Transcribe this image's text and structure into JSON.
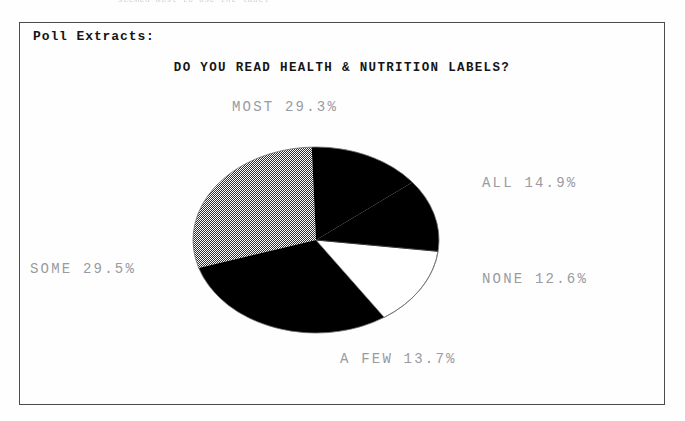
{
  "page": {
    "cut_off_running_text": "seemed most to use the label"
  },
  "panel": {
    "label": "Poll Extracts:"
  },
  "chart_data": {
    "type": "pie",
    "title": "DO YOU READ HEALTH & NUTRITION LABELS?",
    "xlabel": "",
    "ylabel": "",
    "legend_position": "around-slices",
    "grid": false,
    "categories": [
      "MOST",
      "SOME",
      "ALL",
      "A FEW",
      "NONE"
    ],
    "values": [
      29.3,
      29.5,
      14.9,
      13.7,
      12.6
    ],
    "unit": "%",
    "slices": [
      {
        "name": "MOST",
        "value": 29.3,
        "label": "MOST 29.3%",
        "fill": "gray-dither",
        "color": "#8f8f8f",
        "start_angle": 92.0,
        "end_angle": 197.5
      },
      {
        "name": "SOME",
        "value": 29.5,
        "label": "SOME 29.5%",
        "fill": "solid-black",
        "color": "#000000",
        "start_angle": 197.5,
        "end_angle": 303.7
      },
      {
        "name": "A FEW",
        "value": 13.7,
        "label": "A FEW 13.7%",
        "fill": "solid-white",
        "color": "#ffffff",
        "start_angle": 303.7,
        "end_angle": 353.0
      },
      {
        "name": "NONE",
        "value": 12.6,
        "label": "NONE 12.6%",
        "fill": "solid-black",
        "color": "#000000",
        "start_angle": 353.0,
        "end_angle": 38.4
      },
      {
        "name": "ALL",
        "value": 14.9,
        "label": "ALL 14.9%",
        "fill": "solid-black",
        "color": "#000000",
        "start_angle": 38.4,
        "end_angle": 92.0
      }
    ],
    "labels": {
      "most": "MOST 29.3%",
      "all": "ALL 14.9%",
      "none": "NONE 12.6%",
      "a_few": "A FEW 13.7%",
      "some": "SOME 29.5%"
    }
  },
  "colors": {
    "frame": "#4a4a4f",
    "title_text": "#151515",
    "label_text": "#9a9aa0",
    "slice_black": "#000000",
    "slice_gray": "#8f8f8f",
    "slice_white": "#ffffff",
    "background": "#ffffff"
  }
}
